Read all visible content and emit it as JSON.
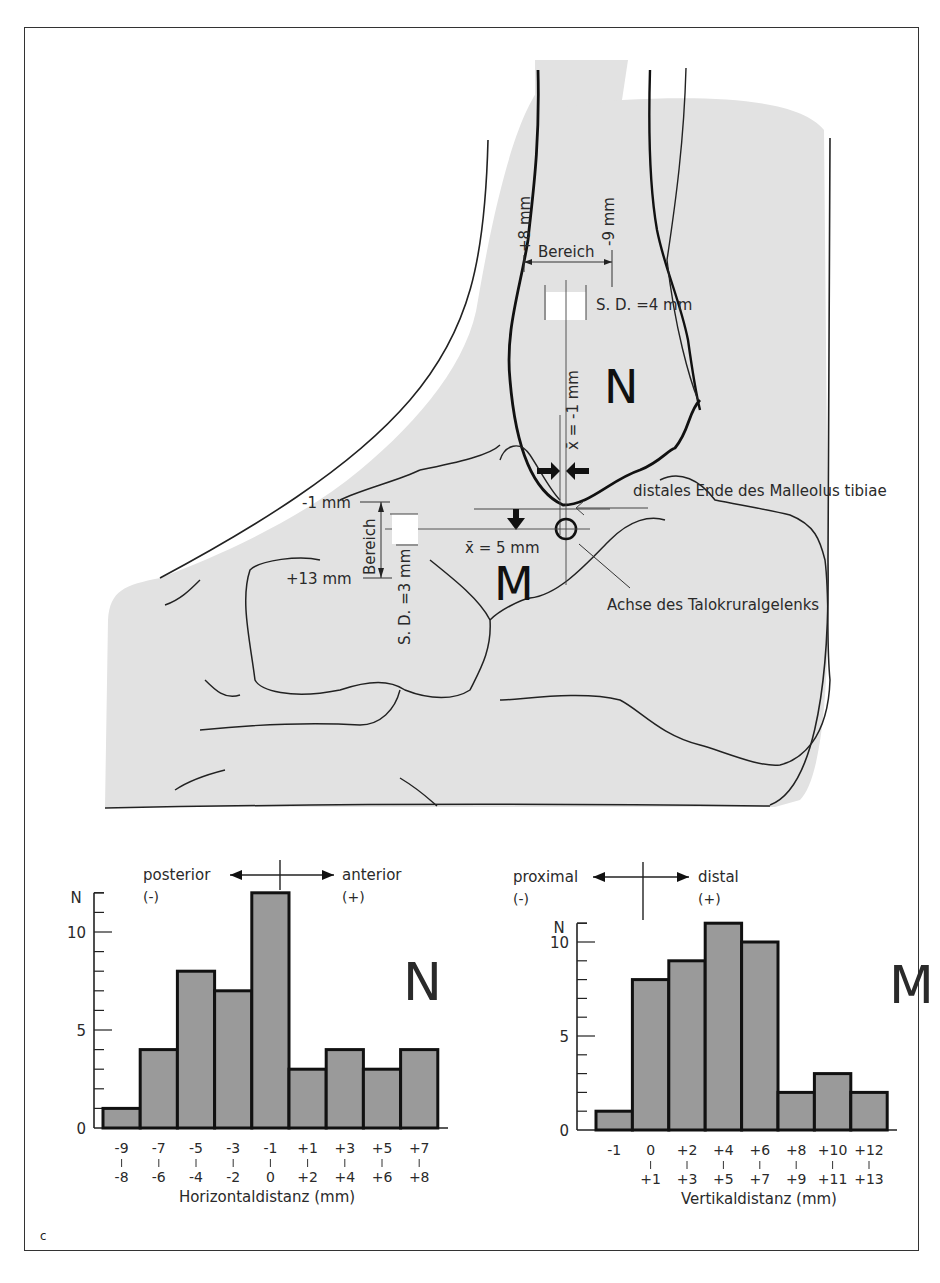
{
  "figure": {
    "panel_letter": "c",
    "anatomy": {
      "label_N": "N",
      "label_M": "M",
      "horizontal": {
        "range_label": "Bereich",
        "range_min": "+8 mm",
        "range_max": "-9 mm",
        "sd": "S. D. =4 mm",
        "mean": "x̄ = -1 mm"
      },
      "vertical": {
        "range_label": "Bereich",
        "range_min": "-1 mm",
        "range_max": "+13 mm",
        "sd": "S. D. =3 mm",
        "mean": "x̄ = 5 mm"
      },
      "annotation_malleolus": "distales Ende des Malleolus tibiae",
      "annotation_axis": "Achse des Talokruralgelenks"
    }
  },
  "chart_data": [
    {
      "type": "bar",
      "id": "N",
      "title": "N",
      "direction_left": "posterior",
      "direction_left_sign": "(-)",
      "direction_right": "anterior",
      "direction_right_sign": "(+)",
      "xlabel": "Horizontaldistanz (mm)",
      "ylabel": "N",
      "categories": [
        "-9 | -8",
        "-7 | -6",
        "-5 | -4",
        "-3 | -2",
        "-1 | 0",
        "+1 | +2",
        "+3 | +4",
        "+5 | +6",
        "+7 | +8"
      ],
      "category_top": [
        "-9",
        "-7",
        "-5",
        "-3",
        "-1",
        "+1",
        "+3",
        "+5",
        "+7"
      ],
      "category_bottom": [
        "-8",
        "-6",
        "-4",
        "-2",
        "0",
        "+2",
        "+4",
        "+6",
        "+8"
      ],
      "values": [
        1,
        4,
        8,
        7,
        12,
        3,
        4,
        3,
        4
      ],
      "yticks": [
        0,
        5,
        10
      ],
      "ylim": [
        0,
        12
      ],
      "grid": false,
      "bar_color": "#9a9a9a"
    },
    {
      "type": "bar",
      "id": "M",
      "title": "M",
      "direction_left": "proximal",
      "direction_left_sign": "(-)",
      "direction_right": "distal",
      "direction_right_sign": "(+)",
      "xlabel": "Vertikaldistanz (mm)",
      "ylabel": "N",
      "categories": [
        "-1",
        "0 | +1",
        "+2 | +3",
        "+4 | +5",
        "+6 | +7",
        "+8 | +9",
        "+10 | +11",
        "+12 | +13"
      ],
      "category_top": [
        "-1",
        "0",
        "+2",
        "+4",
        "+6",
        "+8",
        "+10",
        "+12"
      ],
      "category_bottom": [
        "",
        "+1",
        "+3",
        "+5",
        "+7",
        "+9",
        "+11",
        "+13"
      ],
      "values": [
        1,
        8,
        9,
        11,
        10,
        2,
        3,
        2
      ],
      "yticks": [
        0,
        5,
        10
      ],
      "ylim": [
        0,
        11
      ],
      "grid": false,
      "bar_color": "#9a9a9a"
    }
  ]
}
